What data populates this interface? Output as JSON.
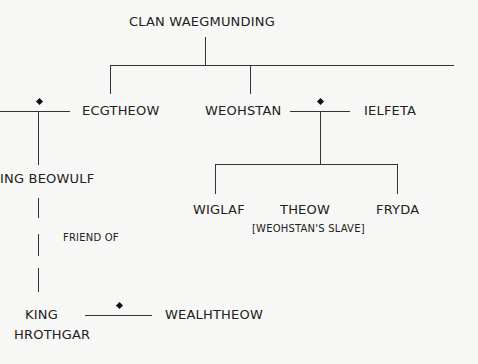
{
  "title": "CLAN WAEGMUNDING",
  "people": {
    "ecgtheow": "ECGTHEOW",
    "weohstan": "WEOHSTAN",
    "ielfeta": "IELFETA",
    "beowulf": "ING BEOWULF",
    "wiglaf": "WIGLAF",
    "theow": "THEOW",
    "theow_note": "[WEOHSTAN'S SLAVE]",
    "fryda": "FRYDA",
    "hrothgar_1": "KING",
    "hrothgar_2": "HROTHGAR",
    "wealhtheow": "WEALHTHEOW"
  },
  "relations": {
    "friend_of": "FRIEND OF"
  }
}
